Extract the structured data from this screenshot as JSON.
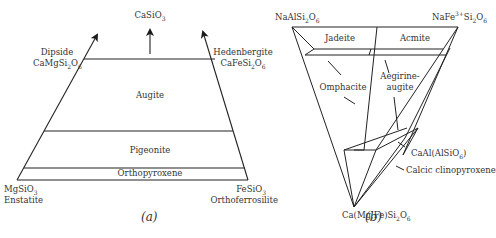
{
  "panel_a": {
    "caption": "(a)",
    "top_label": {
      "formula": "CaSiO",
      "sub": "3"
    },
    "left_top": {
      "name": "Dipside",
      "formula": "CaMgSi",
      "sub1": "2",
      "formula2": "O",
      "sub2": "6"
    },
    "right_top": {
      "name": "Hedenbergite",
      "formula": "CaFeSi",
      "sub1": "2",
      "formula2": "O",
      "sub2": "6"
    },
    "left_bottom": {
      "formula": "MgSiO",
      "sub": "3",
      "name": "Enstatite"
    },
    "right_bottom": {
      "formula": "FeSiO",
      "sub": "3",
      "name": "Orthoferrosilite"
    },
    "fields": [
      "Augite",
      "Pigeonite",
      "Orthopyroxene"
    ]
  },
  "panel_b": {
    "caption": "(b)",
    "top_left": {
      "formula": "NaAlSi",
      "sub1": "2",
      "formula2": "O",
      "sub2": "6"
    },
    "top_right": {
      "formula": "NaFe",
      "sup": "3+",
      "formula2": "Si",
      "sub1": "2",
      "formula3": "O",
      "sub2": "6"
    },
    "bottom": {
      "formula": "Ca(Mg,Fe)Si",
      "sub1": "2",
      "formula2": "O",
      "sub2": "6"
    },
    "right_vertex": {
      "formula": "CaAl(AlSiO",
      "sub": "6",
      "close": ")"
    },
    "fields": [
      "Jadeite",
      "Acmite",
      "Omphacite",
      "Aegirine-",
      "augite",
      "Calcic clinopyroxene"
    ]
  }
}
